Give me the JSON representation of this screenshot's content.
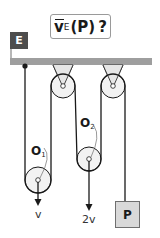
{
  "title": {
    "symbol": "v",
    "subscript": "E",
    "argument": "(P)",
    "question": "?"
  },
  "reference_frame": {
    "label": "E"
  },
  "pulleys": {
    "movable_1": {
      "label": "O",
      "subscript": "1",
      "velocity": "v"
    },
    "movable_2": {
      "label": "O",
      "subscript": "2",
      "velocity": "2v"
    }
  },
  "mass": {
    "label": "P"
  },
  "colors": {
    "ceiling": "#9e9e9e",
    "frame_label_bg": "#4d4d4d",
    "rope": "#1a1a1a",
    "mass_fill": "#d9d9d9",
    "hanger_fill": "#e6e6e6"
  }
}
